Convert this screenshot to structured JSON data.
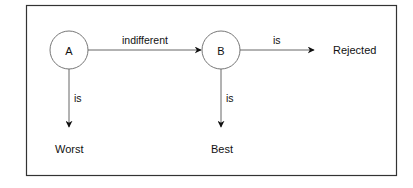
{
  "diagram": {
    "nodes": [
      {
        "id": "A",
        "label": "A",
        "shape": "circle"
      },
      {
        "id": "B",
        "label": "B",
        "shape": "circle"
      }
    ],
    "terminals": [
      {
        "id": "worst",
        "label": "Worst"
      },
      {
        "id": "best",
        "label": "Best"
      },
      {
        "id": "rejected",
        "label": "Rejected"
      }
    ],
    "edges": [
      {
        "from": "A",
        "to": "B",
        "label": "indifferent"
      },
      {
        "from": "B",
        "to": "rejected",
        "label": "is"
      },
      {
        "from": "A",
        "to": "worst",
        "label": "is"
      },
      {
        "from": "B",
        "to": "best",
        "label": "is"
      }
    ],
    "colors": {
      "stroke": "#555555",
      "frame": "#333333",
      "text": "#111111",
      "background": "#ffffff"
    }
  }
}
